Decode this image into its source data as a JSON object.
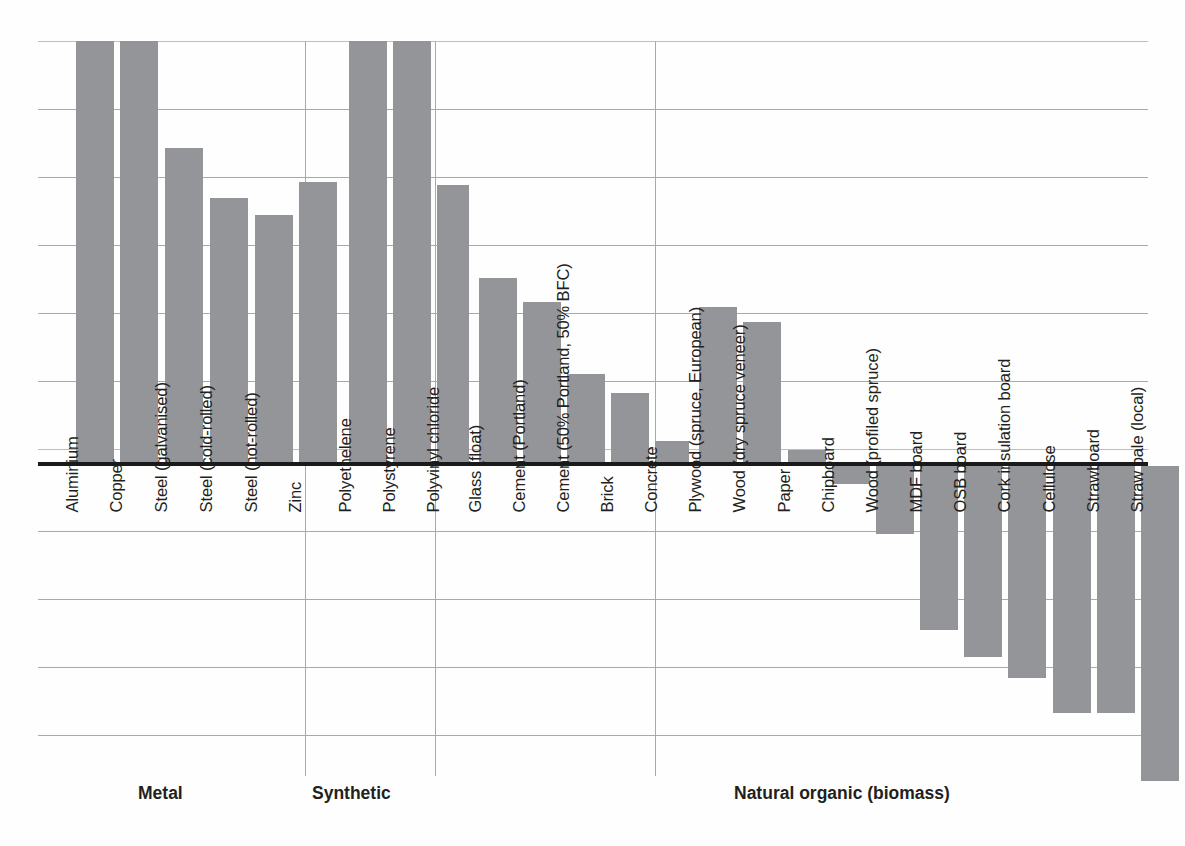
{
  "chart_data": {
    "type": "bar",
    "title": "",
    "subtitle": "",
    "xlabel": "",
    "ylabel": "",
    "grid": true,
    "legend": "none",
    "orientation": "vertical",
    "baseline": 0,
    "note": "Unlabelled axis; values read off evenly spaced gridlines (1 unit = one gridline interval). Positive = above zero line, negative = below. Two bars are clipped at the top of the plot area.",
    "ylim": [
      -5.2,
      6.2
    ],
    "gridline_values": [
      6.2,
      5.2,
      4.2,
      3.2,
      2.2,
      1.2,
      0.2,
      0,
      -0.8,
      -1.8,
      -2.8,
      -3.8,
      -4.8
    ],
    "axis_units": "gridline intervals",
    "categories": [
      "Aluminium",
      "Copper",
      "Steel (galvanised)",
      "Steel (cold-rolled)",
      "Steel (hot-rolled)",
      "Zinc",
      "Polyethelene",
      "Polystyrene",
      "Polyvinyl chloride",
      "Glass (float)",
      "Cement (Portland)",
      "Cement (50% Portland, 50% BFC)",
      "Brick",
      "Concrete",
      "Plywood (spruce, European)",
      "Wood (dry spruce veneer)",
      "Paper",
      "Chipboard",
      "Wood (profiled spruce)",
      "MDF board",
      "OSB board",
      "Cork insulation board",
      "Cellulose",
      "Strawboard",
      "Straw bale (local)"
    ],
    "values": [
      6.2,
      6.2,
      4.6,
      3.9,
      3.6,
      4.1,
      6.2,
      6.2,
      4.1,
      2.7,
      2.35,
      1.3,
      1.0,
      0.3,
      2.28,
      2.06,
      0.18,
      -0.27,
      -1.0,
      -2.4,
      -2.8,
      -3.1,
      -3.6,
      -3.6,
      -4.6
    ],
    "clipped_at_top": [
      "Aluminium",
      "Copper",
      "Polyethelene",
      "Polystyrene"
    ],
    "bar_color": "#939598",
    "groups": [
      {
        "label": "Metal",
        "members": [
          "Aluminium",
          "Copper",
          "Steel (galvanised)",
          "Steel (cold-rolled)",
          "Steel (hot-rolled)",
          "Zinc"
        ]
      },
      {
        "label": "Synthetic",
        "members": [
          "Polyethelene",
          "Polystyrene",
          "Polyvinyl chloride"
        ]
      },
      {
        "label": "",
        "members": [
          "Glass (float)",
          "Cement (Portland)",
          "Cement (50% Portland, 50% BFC)",
          "Brick",
          "Concrete"
        ]
      },
      {
        "label": "Natural organic (biomass)",
        "members": [
          "Plywood (spruce, European)",
          "Wood (dry spruce veneer)",
          "Paper",
          "Chipboard",
          "Wood (profiled spruce)",
          "MDF board",
          "OSB board",
          "Cork insulation board",
          "Cellulose",
          "Strawboard",
          "Straw bale (local)"
        ]
      }
    ]
  },
  "bars": [
    {
      "label": "Aluminium",
      "value": 6.2,
      "x": 38,
      "w": 38,
      "top": 0,
      "height": 421,
      "dir": "up",
      "label_bottom": 455
    },
    {
      "label": "Copper",
      "value": 6.2,
      "x": 82,
      "w": 38,
      "top": 0,
      "height": 421,
      "dir": "up",
      "label_bottom": 455
    },
    {
      "label": "Steel (galvanised)",
      "value": 4.6,
      "x": 127,
      "w": 38,
      "top": 107,
      "height": 314,
      "dir": "up",
      "label_bottom": 455
    },
    {
      "label": "Steel (cold-rolled)",
      "value": 3.9,
      "x": 172,
      "w": 38,
      "top": 157,
      "height": 264,
      "dir": "up",
      "label_bottom": 455
    },
    {
      "label": "Steel (hot-rolled)",
      "value": 3.6,
      "x": 217,
      "w": 38,
      "top": 174,
      "height": 247,
      "dir": "up",
      "label_bottom": 455
    },
    {
      "label": "Zinc",
      "value": 4.1,
      "x": 261,
      "w": 38,
      "top": 141,
      "height": 280,
      "dir": "up",
      "label_bottom": 455
    },
    {
      "label": "Polyethelene",
      "value": 6.2,
      "x": 311,
      "w": 38,
      "top": 0,
      "height": 421,
      "dir": "up",
      "label_bottom": 455
    },
    {
      "label": "Polystyrene",
      "value": 6.2,
      "x": 355,
      "w": 38,
      "top": 0,
      "height": 421,
      "dir": "up",
      "label_bottom": 455
    },
    {
      "label": "Polyvinyl chloride",
      "value": 4.1,
      "x": 399,
      "w": 32,
      "top": 144,
      "height": 277,
      "dir": "up",
      "label_bottom": 455
    },
    {
      "label": "Glass (float)",
      "value": 2.7,
      "x": 441,
      "w": 38,
      "top": 237,
      "height": 184,
      "dir": "up",
      "label_bottom": 455
    },
    {
      "label": "Cement (Portland)",
      "value": 2.35,
      "x": 485,
      "w": 38,
      "top": 261,
      "height": 160,
      "dir": "up",
      "label_bottom": 455
    },
    {
      "label": "Cement (50% Portland, 50% BFC)",
      "value": 1.3,
      "x": 529,
      "w": 38,
      "top": 333,
      "height": 88,
      "dir": "up",
      "label_bottom": 455
    },
    {
      "label": "Brick",
      "value": 1.0,
      "x": 573,
      "w": 38,
      "top": 352,
      "height": 69,
      "dir": "up",
      "label_bottom": 455
    },
    {
      "label": "Concrete",
      "value": 0.3,
      "x": 617,
      "w": 34,
      "top": 400,
      "height": 21,
      "dir": "up",
      "label_bottom": 455
    },
    {
      "label": "Plywood (spruce, European)",
      "value": 2.28,
      "x": 661,
      "w": 38,
      "top": 266,
      "height": 155,
      "dir": "up",
      "label_bottom": 455
    },
    {
      "label": "Wood (dry spruce veneer)",
      "value": 2.06,
      "x": 705,
      "w": 38,
      "top": 281,
      "height": 140,
      "dir": "up",
      "label_bottom": 455
    },
    {
      "label": "Paper",
      "value": 0.18,
      "x": 750,
      "w": 38,
      "top": 409,
      "height": 12,
      "dir": "up",
      "label_bottom": 455
    },
    {
      "label": "Chipboard",
      "value": -0.27,
      "x": 794,
      "w": 38,
      "top": 425,
      "height": 18,
      "dir": "down",
      "label_bottom": 455
    },
    {
      "label": "Wood (profiled spruce)",
      "value": -1.0,
      "x": 838,
      "w": 38,
      "top": 425,
      "height": 68,
      "dir": "down",
      "label_bottom": 455
    },
    {
      "label": "MDF board",
      "value": -2.4,
      "x": 882,
      "w": 38,
      "top": 425,
      "height": 164,
      "dir": "down",
      "label_bottom": 455
    },
    {
      "label": "OSB board",
      "value": -2.8,
      "x": 926,
      "w": 38,
      "top": 425,
      "height": 191,
      "dir": "down",
      "label_bottom": 455
    },
    {
      "label": "Cork insulation board",
      "value": -3.1,
      "x": 970,
      "w": 38,
      "top": 425,
      "height": 212,
      "dir": "down",
      "label_bottom": 455
    },
    {
      "label": "Cellulose",
      "value": -3.6,
      "x": 1015,
      "w": 38,
      "top": 425,
      "height": 247,
      "dir": "down",
      "label_bottom": 455
    },
    {
      "label": "Strawboard",
      "value": -3.6,
      "x": 1059,
      "w": 38,
      "top": 425,
      "height": 247,
      "dir": "down",
      "label_bottom": 455
    },
    {
      "label": "Straw bale (local)",
      "value": -4.6,
      "x": 1103,
      "w": 38,
      "top": 425,
      "height": 315,
      "dir": "down",
      "label_bottom": 455
    }
  ],
  "gridlines": [
    {
      "y": 0,
      "faint": true
    },
    {
      "y": 68,
      "faint": false
    },
    {
      "y": 136,
      "faint": false
    },
    {
      "y": 204,
      "faint": false
    },
    {
      "y": 272,
      "faint": false
    },
    {
      "y": 340,
      "faint": false
    },
    {
      "y": 408,
      "faint": true
    },
    {
      "y": 490,
      "faint": false
    },
    {
      "y": 558,
      "faint": false
    },
    {
      "y": 626,
      "faint": false
    },
    {
      "y": 694,
      "faint": false
    }
  ],
  "separators": [
    {
      "x": 267,
      "top": 0,
      "height": 735
    },
    {
      "x": 397,
      "top": 0,
      "height": 735
    },
    {
      "x": 617,
      "top": 0,
      "height": 735
    }
  ],
  "group_captions": [
    {
      "label": "Metal",
      "left": 138,
      "top": 783
    },
    {
      "label": "Synthetic",
      "left": 312,
      "top": 783
    },
    {
      "label": "Natural organic (biomass)",
      "left": 734,
      "top": 783
    }
  ]
}
